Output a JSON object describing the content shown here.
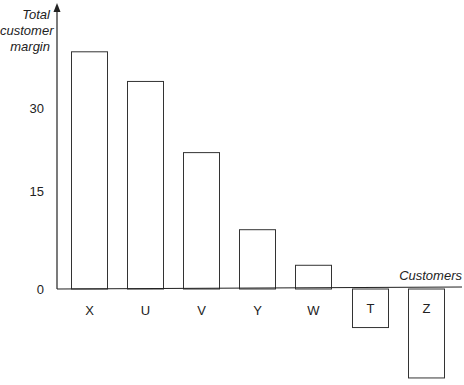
{
  "chart_data": {
    "type": "bar",
    "title": "",
    "xlabel": "Customers",
    "ylabel": "Total customer margin",
    "ylabel_lines": [
      "Total",
      "customer",
      "margin"
    ],
    "categories": [
      "X",
      "U",
      "V",
      "Y",
      "W",
      "T",
      "Z"
    ],
    "values": [
      40,
      35,
      23,
      10,
      4,
      -6.5,
      -15
    ],
    "yticks": [
      0,
      15,
      30
    ],
    "ytick_labels": [
      "0",
      "15",
      "30"
    ],
    "ylim": [
      -15,
      45
    ],
    "grid": false,
    "legend": null
  },
  "colors": {
    "axis": "#222222",
    "bar_fill": "#ffffff",
    "bar_stroke": "#333333"
  }
}
